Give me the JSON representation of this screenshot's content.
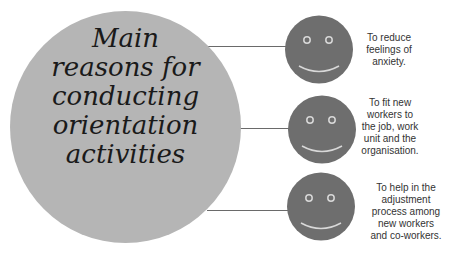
{
  "diagram": {
    "title_lines": [
      "Main",
      "reasons for",
      "conducting",
      "orientation",
      "activities"
    ],
    "colors": {
      "main_circle": "#b5b5b5",
      "face": "#6e6e6e",
      "face_features": "#d8d8d8",
      "connector": "#6a6a6a",
      "text": "#333333"
    },
    "reasons": [
      {
        "icon": "smiley-face-icon",
        "lines": [
          "To reduce",
          "feelings of",
          "anxiety."
        ]
      },
      {
        "icon": "smiley-face-icon",
        "lines": [
          "To fit new",
          "workers to",
          "the job, work",
          "unit and the",
          "organisation."
        ]
      },
      {
        "icon": "smiley-face-icon",
        "lines": [
          "To help in the",
          "adjustment",
          "process among",
          "new workers",
          "and co-workers."
        ]
      }
    ]
  }
}
